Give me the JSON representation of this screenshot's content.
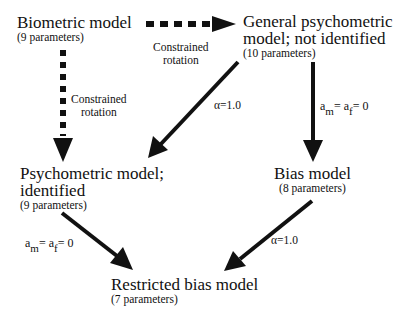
{
  "nodes": {
    "biometric": {
      "title": "Biometric model",
      "params": "(9 parameters)"
    },
    "general": {
      "title_line1": "General psychometric",
      "title_line2": "model; not identified",
      "params": "(10 parameters)"
    },
    "psychometric": {
      "title_line1": "Psychometric model;",
      "title_line2": "identified",
      "params": "(9 parameters)"
    },
    "bias": {
      "title": "Bias model",
      "params": "(8 parameters)"
    },
    "restricted": {
      "title": "Restricted bias model",
      "params": "(7 parameters)"
    }
  },
  "edges": {
    "bio_to_general": {
      "label_line1": "Constrained",
      "label_line2": "rotation",
      "style": "dashed"
    },
    "bio_to_psych": {
      "label_line1": "Constrained",
      "label_line2": "rotation",
      "style": "dashed"
    },
    "general_to_psych": {
      "label": "α=1.0",
      "style": "solid"
    },
    "general_to_bias": {
      "a": "a",
      "m": "m",
      "eq1": "= a",
      "f": "f",
      "eq2": "= 0",
      "style": "solid"
    },
    "psych_to_restricted": {
      "a": "a",
      "m": "m",
      "eq1": "= a",
      "f": "f",
      "eq2": "= 0",
      "style": "solid"
    },
    "bias_to_restricted": {
      "label": "α=1.0",
      "style": "solid"
    }
  },
  "colors": {
    "arrow": "#111111",
    "text": "#111111",
    "background": "#ffffff"
  }
}
